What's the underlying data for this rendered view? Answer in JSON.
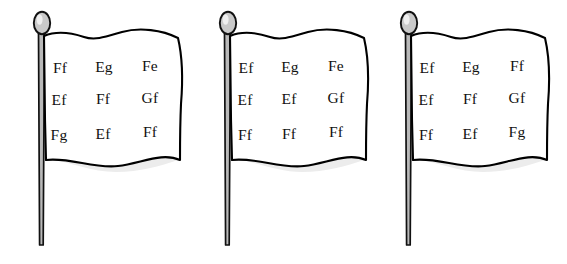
{
  "scene": {
    "title": "Three flags with letter-pair grids",
    "background_color": "#ffffff",
    "ink_color": "#000000",
    "cloth_color": "#ffffff",
    "cloth_shade_color": "#ececec",
    "pole_color": "#b9b9b9",
    "finial_color": "#c9c9c9"
  },
  "flags": [
    {
      "name": "flag-1",
      "rows": [
        [
          "Ff",
          "Eg",
          "Fe"
        ],
        [
          "Ef",
          "Ff",
          "Gf"
        ],
        [
          "Fg",
          "Ef",
          "Ff"
        ]
      ]
    },
    {
      "name": "flag-2",
      "rows": [
        [
          "Ef",
          "Eg",
          "Fe"
        ],
        [
          "Ef",
          "Ef",
          "Gf"
        ],
        [
          "Ff",
          "Ff",
          "Ff"
        ]
      ]
    },
    {
      "name": "flag-3",
      "rows": [
        [
          "Ef",
          "Eg",
          "Ff"
        ],
        [
          "Ef",
          "Ff",
          "Gf"
        ],
        [
          "Ff",
          "Ef",
          "Fg"
        ]
      ]
    }
  ]
}
